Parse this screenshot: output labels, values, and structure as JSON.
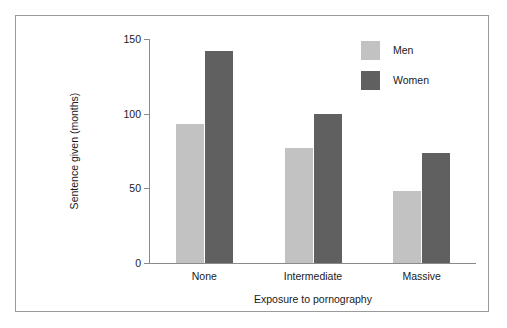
{
  "chart_data": {
    "type": "bar",
    "title": "",
    "subtitle": "",
    "xlabel": "Exposure to pornography",
    "ylabel": "Sentence given (months)",
    "categories": [
      "None",
      "Intermediate",
      "Massive"
    ],
    "series": [
      {
        "name": "Men",
        "color": "#c2c2c2",
        "values": [
          93,
          77,
          48
        ]
      },
      {
        "name": "Women",
        "color": "#606060",
        "values": [
          142,
          100,
          74
        ]
      }
    ],
    "ylim": [
      0,
      150
    ],
    "yticks": [
      0,
      50,
      100,
      150
    ],
    "ytick_labels": [
      "0",
      "50",
      "100",
      "150"
    ],
    "grid": false,
    "legend_position": "top-right",
    "legend_entries": [
      "Men",
      "Women"
    ],
    "bar_grouping": "grouped",
    "frame": {
      "border_color": "#9a9a9a",
      "axis_color": "#8a8a8a"
    }
  },
  "figure": {
    "background": "#ffffff"
  }
}
